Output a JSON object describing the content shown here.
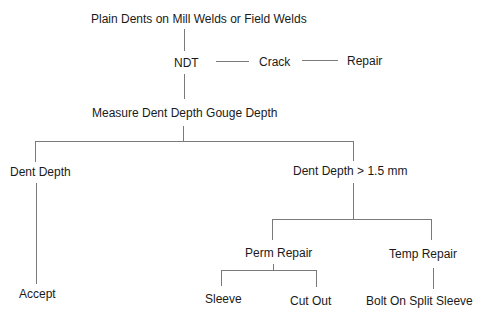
{
  "diagram": {
    "type": "decision-tree",
    "nodes": {
      "root": "Plain Dents on Mill Welds or Field Welds",
      "ndt": "NDT",
      "crack": "Crack",
      "repair": "Repair",
      "measure": "Measure Dent Depth Gouge Depth",
      "dent_depth": "Dent Depth",
      "dent_depth_gt": "Dent Depth > 1.5 mm",
      "accept": "Accept",
      "perm_repair": "Perm Repair",
      "temp_repair": "Temp Repair",
      "sleeve": "Sleeve",
      "cut_out": "Cut Out",
      "bolt_on": "Bolt On Split Sleeve"
    },
    "edges": [
      [
        "root",
        "ndt"
      ],
      [
        "ndt",
        "crack"
      ],
      [
        "crack",
        "repair"
      ],
      [
        "ndt",
        "measure"
      ],
      [
        "measure",
        "dent_depth"
      ],
      [
        "measure",
        "dent_depth_gt"
      ],
      [
        "dent_depth",
        "accept"
      ],
      [
        "dent_depth_gt",
        "perm_repair"
      ],
      [
        "dent_depth_gt",
        "temp_repair"
      ],
      [
        "perm_repair",
        "sleeve"
      ],
      [
        "perm_repair",
        "cut_out"
      ],
      [
        "temp_repair",
        "bolt_on"
      ]
    ],
    "colors": {
      "text": "#1a1a1a",
      "line": "#7a7a7a",
      "background": "#ffffff"
    }
  }
}
